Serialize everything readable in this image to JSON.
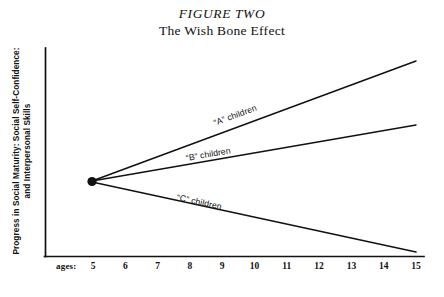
{
  "figure": {
    "title": "FIGURE TWO",
    "subtitle": "The Wish Bone Effect",
    "y_axis_caption_line1": "Progress in Social Maturity: Social Self-Confidence:",
    "y_axis_caption_line2": "and Interpersonal Skills",
    "x_axis_caption": "ages:",
    "ink_color": "#111111",
    "background_color": "#ffffff"
  },
  "chart_data": {
    "type": "line",
    "xlabel": "ages:",
    "ylabel": "Progress in Social Maturity: Social Self-Confidence: and Interpersonal Skills",
    "x": [
      5,
      6,
      7,
      8,
      9,
      10,
      11,
      12,
      13,
      14,
      15
    ],
    "xtick_labels": [
      "5",
      "6",
      "7",
      "8",
      "9",
      "10",
      "11",
      "12",
      "13",
      "14",
      "15"
    ],
    "xlim": [
      5,
      15.8
    ],
    "ylim": [
      0,
      100
    ],
    "grid": false,
    "legend": "inline-annotations",
    "yticks": [],
    "ytick_labels": [],
    "origin_point": {
      "x": 5,
      "y": 50,
      "marker": "filled-circle"
    },
    "series": [
      {
        "name": "“A” children",
        "label": "“A” children",
        "values": [
          50,
          57,
          64,
          71,
          78,
          85,
          92,
          99,
          106,
          113,
          120
        ],
        "x_start": 5,
        "x_end": 15.8,
        "y_start": 50,
        "y_end": 127,
        "slope": "steep-rising"
      },
      {
        "name": "“B” children",
        "label": "“B” children",
        "values": [
          50,
          53,
          56,
          59,
          62,
          65,
          68,
          71,
          74,
          77,
          80
        ],
        "x_start": 5,
        "x_end": 15.8,
        "y_start": 50,
        "y_end": 82,
        "slope": "gentle-rising"
      },
      {
        "name": "“C” children",
        "label": "“C” children",
        "values": [
          50,
          46.5,
          43,
          39.5,
          36,
          32.5,
          29,
          25.5,
          22,
          18.5,
          15
        ],
        "x_start": 5,
        "x_end": 15.8,
        "y_start": 50,
        "y_end": 11,
        "slope": "falling"
      }
    ],
    "annotations": [
      {
        "text": "“A” children",
        "along_series": "“A” children"
      },
      {
        "text": "“B” children",
        "along_series": "“B” children"
      },
      {
        "text": "“C” children",
        "along_series": "“C” children"
      }
    ]
  }
}
